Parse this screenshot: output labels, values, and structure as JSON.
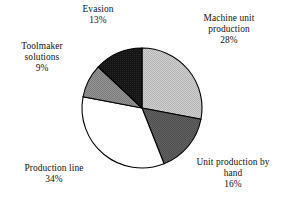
{
  "chart_data": {
    "type": "pie",
    "title": "",
    "subtitle": "",
    "xlabel": "",
    "ylabel": "",
    "legend_position": "none",
    "labels_position": "outside",
    "grid": false,
    "units": "%",
    "start_angle_deg": 0,
    "direction": "clockwise",
    "categories": [
      "Machine unit production",
      "Unit production by hand",
      "Production line",
      "Toolmaker solutions",
      "Evasion"
    ],
    "values": [
      28,
      16,
      34,
      9,
      13
    ],
    "total": 100,
    "slices": [
      {
        "label": "Machine unit production",
        "label_line1": "Machine unit",
        "label_line2": "production",
        "value": 28,
        "value_text": "28%",
        "color": "#c4c4c4",
        "edge_color": "#000000",
        "start_deg": 0,
        "end_deg": 100.8
      },
      {
        "label": "Unit production by hand",
        "label_line1": "Unit production by",
        "label_line2": "hand",
        "value": 16,
        "value_text": "16%",
        "color": "#595959",
        "edge_color": "#000000",
        "start_deg": 100.8,
        "end_deg": 158.4
      },
      {
        "label": "Production line",
        "label_line1": "Production line",
        "label_line2": "",
        "value": 34,
        "value_text": "34%",
        "color": "#ffffff",
        "edge_color": "#000000",
        "start_deg": 158.4,
        "end_deg": 280.8
      },
      {
        "label": "Toolmaker solutions",
        "label_line1": "Toolmaker",
        "label_line2": "solutions",
        "value": 9,
        "value_text": "9%",
        "color": "#8a8a8a",
        "edge_color": "#000000",
        "start_deg": 280.8,
        "end_deg": 313.2
      },
      {
        "label": "Evasion",
        "label_line1": "Evasion",
        "label_line2": "",
        "value": 13,
        "value_text": "13%",
        "color": "#1a1a1a",
        "edge_color": "#000000",
        "start_deg": 313.2,
        "end_deg": 360
      }
    ]
  },
  "labels": {
    "evasion": {
      "name": "Evasion",
      "value": "13%"
    },
    "machine": {
      "name_line1": "Machine unit",
      "name_line2": "production",
      "value": "28%"
    },
    "toolmaker": {
      "name_line1": "Toolmaker",
      "name_line2": "solutions",
      "value": "9%"
    },
    "production_line": {
      "name": "Production line",
      "value": "34%"
    },
    "hand": {
      "name_line1": "Unit production by",
      "name_line2": "hand",
      "value": "16%"
    }
  },
  "colors": {
    "background": "#ffffff",
    "text": "#121212",
    "outline": "#000000",
    "slice_machine": "#c4c4c4",
    "slice_hand": "#595959",
    "slice_production_line": "#ffffff",
    "slice_toolmaker": "#8a8a8a",
    "slice_evasion": "#1a1a1a"
  }
}
